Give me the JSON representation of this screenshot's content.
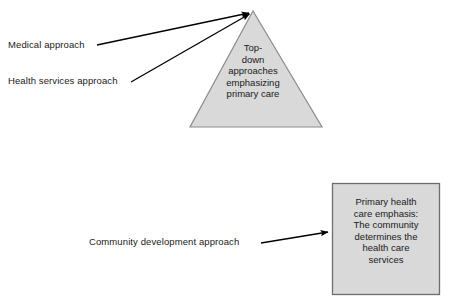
{
  "diagram": {
    "background_color": "#ffffff",
    "shape_fill_color": "#d9d9d9",
    "shape_stroke_color": "#808080",
    "line_color": "#000000",
    "text_color": "#1a1a1a"
  },
  "labels": {
    "medical": "Medical approach",
    "health_services": "Health services approach",
    "community_development": "Community development approach"
  },
  "triangle": {
    "name": "top-down-triangle",
    "lines": [
      "Top-",
      "down",
      "approaches",
      "emphasizing",
      "primary care"
    ],
    "full_text": "Top-down approaches emphasizing primary care",
    "apex": {
      "x": 253,
      "y": 11
    },
    "base_left": {
      "x": 190,
      "y": 127
    },
    "base_right": {
      "x": 322,
      "y": 127
    }
  },
  "box": {
    "name": "primary-health-care-box",
    "lines": [
      "Primary health",
      "care emphasis:",
      "The community",
      "determines the",
      "health care",
      "services"
    ],
    "full_text": "Primary health care emphasis: The community determines the health care services",
    "left": 332,
    "top": 183,
    "width": 108,
    "height": 112
  },
  "connectors": [
    {
      "name": "medical-to-triangle",
      "from_label": "medical",
      "to_shape": "top-down-triangle",
      "start": {
        "x": 97,
        "y": 45
      },
      "end": {
        "x": 251,
        "y": 12
      },
      "arrowhead": true
    },
    {
      "name": "health-services-to-triangle",
      "from_label": "health_services",
      "to_shape": "top-down-triangle",
      "start": {
        "x": 131,
        "y": 82
      },
      "end": {
        "x": 251,
        "y": 13
      },
      "arrowhead": true
    },
    {
      "name": "community-to-box",
      "from_label": "community_development",
      "to_shape": "primary-health-care-box",
      "start": {
        "x": 261,
        "y": 243
      },
      "end": {
        "x": 331,
        "y": 232
      },
      "arrowhead": true
    }
  ]
}
